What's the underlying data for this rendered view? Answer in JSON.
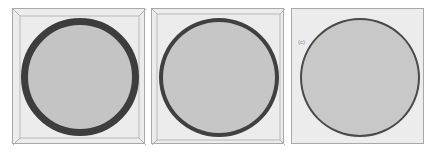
{
  "figure": {
    "panels": [
      {
        "id": "panel-1",
        "ring_thickness_px": 7,
        "ring_color": "#3d3d3d",
        "fill_color": "#c4c4c4",
        "label": ""
      },
      {
        "id": "panel-2",
        "ring_thickness_px": 4,
        "ring_color": "#404040",
        "fill_color": "#c6c6c6",
        "label": ""
      },
      {
        "id": "panel-3",
        "ring_thickness_px": 2,
        "ring_color": "#4a4a4a",
        "fill_color": "#c8c8c8",
        "label": "(c)"
      }
    ],
    "background_color": "#ececec",
    "frame_color": "#a8a8a8"
  }
}
